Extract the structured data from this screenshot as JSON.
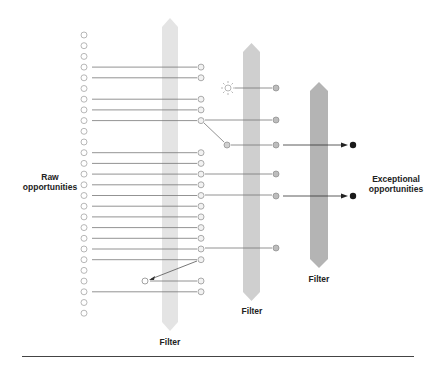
{
  "labels": {
    "raw": "Raw\nopportunities",
    "raw_line1": "Raw",
    "raw_line2": "opportunities",
    "exceptional_line1": "Exceptional",
    "exceptional_line2": "opportunities",
    "filter1": "Filter",
    "filter2": "Filter",
    "filter3": "Filter"
  },
  "colors": {
    "filter1": "#e3e3e3",
    "filter2": "#cfcfcf",
    "filter3": "#b3b3b3",
    "circle_stroke": "#9a9a9a",
    "col3_fill": "#bdbdbd",
    "final_dot": "#1a1a1a",
    "line": "#6e6e6e"
  },
  "icons": {
    "idea": "sun-icon"
  },
  "layout": {
    "left_circles": {
      "x": 84,
      "y_start": 35,
      "spacing": 10.7,
      "count": 27
    },
    "col2_x": 201,
    "col3_x": 276,
    "final_x": 353
  },
  "connections": {
    "stage1_rows": [
      3,
      4,
      6,
      7,
      8,
      11,
      12,
      13,
      14,
      15,
      16,
      17,
      18,
      19,
      20,
      24
    ],
    "stage2": [
      {
        "from_row": 8,
        "to_y": 120
      },
      {
        "from_row": 13,
        "to_y": 174
      },
      {
        "from_row": 15,
        "to_y": 195
      },
      {
        "from_row": 20,
        "to_y": 248
      }
    ],
    "finals": [
      145,
      196
    ]
  }
}
